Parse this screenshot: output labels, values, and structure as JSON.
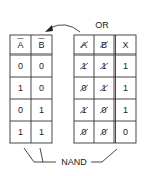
{
  "left_table": {
    "headers": [
      "A",
      "B"
    ],
    "header_overbar": [
      true,
      true
    ],
    "rows": [
      [
        "0",
        "0"
      ],
      [
        "1",
        "0"
      ],
      [
        "0",
        "1"
      ],
      [
        "1",
        "1"
      ]
    ]
  },
  "right_table": {
    "label": "OR",
    "headers": [
      "A",
      "B",
      "X"
    ],
    "header_struck": [
      true,
      true,
      false
    ],
    "rows": [
      [
        "1",
        "1",
        "1"
      ],
      [
        "0",
        "1",
        "1"
      ],
      [
        "1",
        "0",
        "1"
      ],
      [
        "0",
        "0",
        "0"
      ]
    ],
    "struck_columns": [
      0,
      1
    ]
  },
  "nand_label": "NAND",
  "arrow": {
    "direction": "from-right-table-to-left-table"
  }
}
